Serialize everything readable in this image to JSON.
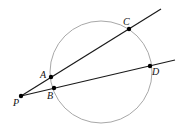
{
  "diagram": {
    "type": "geometry",
    "circle": {
      "cx": 101,
      "cy": 72,
      "r": 51,
      "stroke": "#a8a8a8"
    },
    "line_color": "#1a1a1a",
    "point_color": "#000000",
    "secants": [
      {
        "name": "PAC",
        "from": [
          21,
          96
        ],
        "to": [
          161,
          9
        ],
        "through": [
          "A",
          "C"
        ]
      },
      {
        "name": "PBD",
        "from": [
          21,
          96
        ],
        "to": [
          175,
          60
        ],
        "through": [
          "B",
          "D"
        ]
      }
    ],
    "points": [
      {
        "label": "P",
        "x": 21,
        "y": 96,
        "lx": 13,
        "ly": 106
      },
      {
        "label": "A",
        "x": 51,
        "y": 77,
        "lx": 40,
        "ly": 78
      },
      {
        "label": "B",
        "x": 54,
        "y": 88,
        "lx": 47,
        "ly": 99
      },
      {
        "label": "C",
        "x": 129,
        "y": 29,
        "lx": 123,
        "ly": 25
      },
      {
        "label": "D",
        "x": 150,
        "y": 66,
        "lx": 152,
        "ly": 75
      }
    ]
  }
}
